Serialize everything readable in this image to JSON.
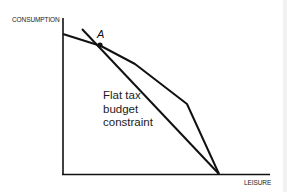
{
  "diagram": {
    "type": "budget-constraint",
    "axes": {
      "y_label": "CONSUMPTION",
      "x_label": "LEISURE"
    },
    "point": {
      "label": "A"
    },
    "annotation": {
      "lines": [
        "Flat tax",
        "budget",
        "constraint"
      ]
    },
    "colors": {
      "line": "#111111",
      "background": "#ffffff",
      "text": "#222222"
    },
    "curves": [
      {
        "name": "progressive-tax-kinked-budget-constraint",
        "points": [
          [
            63,
            34
          ],
          [
            101,
            46
          ],
          [
            135,
            64
          ],
          [
            187,
            104
          ],
          [
            219,
            174
          ]
        ]
      },
      {
        "name": "flat-tax-budget-constraint",
        "points": [
          [
            82,
            29
          ],
          [
            219,
            174
          ]
        ]
      }
    ]
  }
}
